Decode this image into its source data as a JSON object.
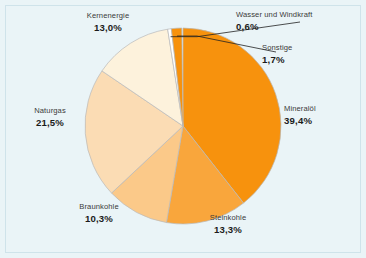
{
  "figure": {
    "background_color": "#eaf4f7",
    "frame_color": "#cfe3ea"
  },
  "chart_data": {
    "type": "pie",
    "title": "",
    "subtitle": "",
    "xlabel": "",
    "ylabel": "",
    "grid": false,
    "legend_position": "none",
    "units": "%",
    "decimal_separator": ",",
    "start_angle_deg": 0,
    "direction": "clockwise",
    "center": {
      "x": 183,
      "y": 126
    },
    "radius": 98,
    "categories": [
      "Mineralöl",
      "Steinkohle",
      "Braunkohle",
      "Naturgas",
      "Kernenergie",
      "Wasser und Windkraft",
      "Sonstige"
    ],
    "values": [
      39.4,
      13.3,
      10.3,
      21.5,
      13.0,
      0.6,
      1.7
    ],
    "value_labels": [
      "39,4%",
      "13,3%",
      "10,3%",
      "21,5%",
      "13,0%",
      "0,6%",
      "1,7%"
    ],
    "colors": [
      "#f7920d",
      "#f9a63c",
      "#fbc989",
      "#fbdcb4",
      "#fdf2dc",
      "#ffffff",
      "#f7920d"
    ],
    "slices": [
      {
        "name": "Mineralöl",
        "label": "Mineralöl",
        "value": 39.4,
        "value_label": "39,4%",
        "color": "#f7920d",
        "start_deg": 0.0,
        "end_deg": 141.84,
        "leader_line": false
      },
      {
        "name": "Steinkohle",
        "label": "Steinkohle",
        "value": 13.3,
        "value_label": "13,3%",
        "color": "#f9a63c",
        "start_deg": 141.84,
        "end_deg": 189.72,
        "leader_line": false
      },
      {
        "name": "Braunkohle",
        "label": "Braunkohle",
        "value": 10.3,
        "value_label": "10,3%",
        "color": "#fbc989",
        "start_deg": 189.72,
        "end_deg": 226.8,
        "leader_line": false
      },
      {
        "name": "Naturgas",
        "label": "Naturgas",
        "value": 21.5,
        "value_label": "21,5%",
        "color": "#fbdcb4",
        "start_deg": 226.8,
        "end_deg": 304.2,
        "leader_line": false
      },
      {
        "name": "Kernenergie",
        "label": "Kernenergie",
        "value": 13.0,
        "value_label": "13,0%",
        "color": "#fdf2dc",
        "start_deg": 304.2,
        "end_deg": 351.0,
        "leader_line": false
      },
      {
        "name": "Wasser und Windkraft",
        "label": "Wasser und Windkraft",
        "value": 0.6,
        "value_label": "0,6%",
        "color": "#ffffff",
        "start_deg": 351.0,
        "end_deg": 353.16,
        "leader_line": true
      },
      {
        "name": "Sonstige",
        "label": "Sonstige",
        "value": 1.7,
        "value_label": "1,7%",
        "color": "#f7920d",
        "start_deg": 353.16,
        "end_deg": 359.28,
        "leader_line": true
      }
    ]
  }
}
